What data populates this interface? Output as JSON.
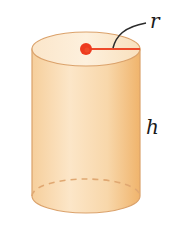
{
  "figure": {
    "shape": "cylinder",
    "labels": {
      "radius": "r",
      "height": "h"
    },
    "colors": {
      "body_light": "#fbe3c2",
      "body_mid": "#f7d3a4",
      "body_dark": "#f0b56f",
      "top_face": "#fcebd3",
      "outline": "#dba26b",
      "radius_line": "#ee4a2a",
      "center_dot": "#ee3b1f",
      "leader_line": "#2b2b2b"
    }
  }
}
